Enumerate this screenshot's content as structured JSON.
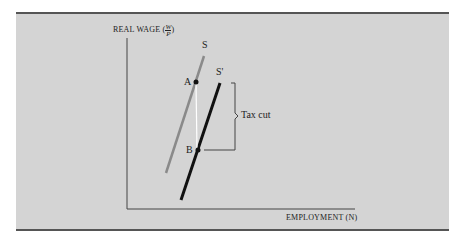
{
  "figure": {
    "y_axis_label": "REAL WAGE (",
    "y_axis_fraction_num": "W",
    "y_axis_fraction_den": "P",
    "y_axis_label_close": ")",
    "x_axis_label": "EMPLOYMENT (N)",
    "curves": [
      {
        "name": "S",
        "label": "S",
        "color": "#8a8a8a"
      },
      {
        "name": "S'",
        "label": "S'",
        "color": "#111111"
      }
    ],
    "points": [
      {
        "name": "A",
        "label": "A"
      },
      {
        "name": "B",
        "label": "B"
      }
    ],
    "annotation": "Tax cut"
  }
}
